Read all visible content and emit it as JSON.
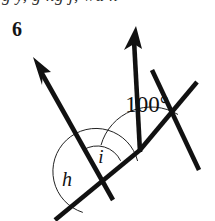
{
  "page": {
    "width": 215,
    "height": 221,
    "background_color": "#ffffff",
    "ink_color": "#111111"
  },
  "clipped_header": {
    "text": "g y, g ng j, wu n",
    "note": "partially cropped line of italic running text at top edge"
  },
  "question": {
    "number": "6"
  },
  "figure": {
    "type": "geometry-angle-diagram",
    "labels": {
      "angle_h": "h",
      "angle_i": "i",
      "angle_degrees": "100°"
    },
    "vertices": {
      "left_intersection": [
        97,
        172
      ],
      "bend_vertex": [
        140,
        150
      ],
      "right_intersection": [
        170,
        106
      ]
    },
    "rays": [
      {
        "name": "left-ray",
        "from": [
          97,
          172
        ],
        "to": [
          36,
          64
        ],
        "arrow": "up-left"
      },
      {
        "name": "right-ray",
        "from": [
          140,
          150
        ],
        "to": [
          136,
          30
        ],
        "arrow": "up-right"
      }
    ],
    "segments": [
      {
        "name": "lower-transversal",
        "from": [
          55,
          218
        ],
        "to": [
          140,
          150
        ]
      },
      {
        "name": "upper-transversal",
        "from": [
          140,
          150
        ],
        "to": [
          197,
          82
        ]
      },
      {
        "name": "left-ray-tail",
        "from": [
          97,
          172
        ],
        "to": [
          112,
          198
        ]
      },
      {
        "name": "right-descender",
        "from": [
          170,
          106
        ],
        "to": [
          199,
          168
        ]
      }
    ],
    "arcs": [
      {
        "name": "arc-h",
        "center": [
          97,
          172
        ],
        "radius": 43,
        "sweep_degrees": 200
      },
      {
        "name": "arc-i",
        "center": [
          97,
          172
        ],
        "radius": 26,
        "sweep_degrees": 103
      },
      {
        "name": "arc-100",
        "center": [
          140,
          150
        ],
        "radius": 52,
        "sweep_degrees": 100
      }
    ]
  }
}
